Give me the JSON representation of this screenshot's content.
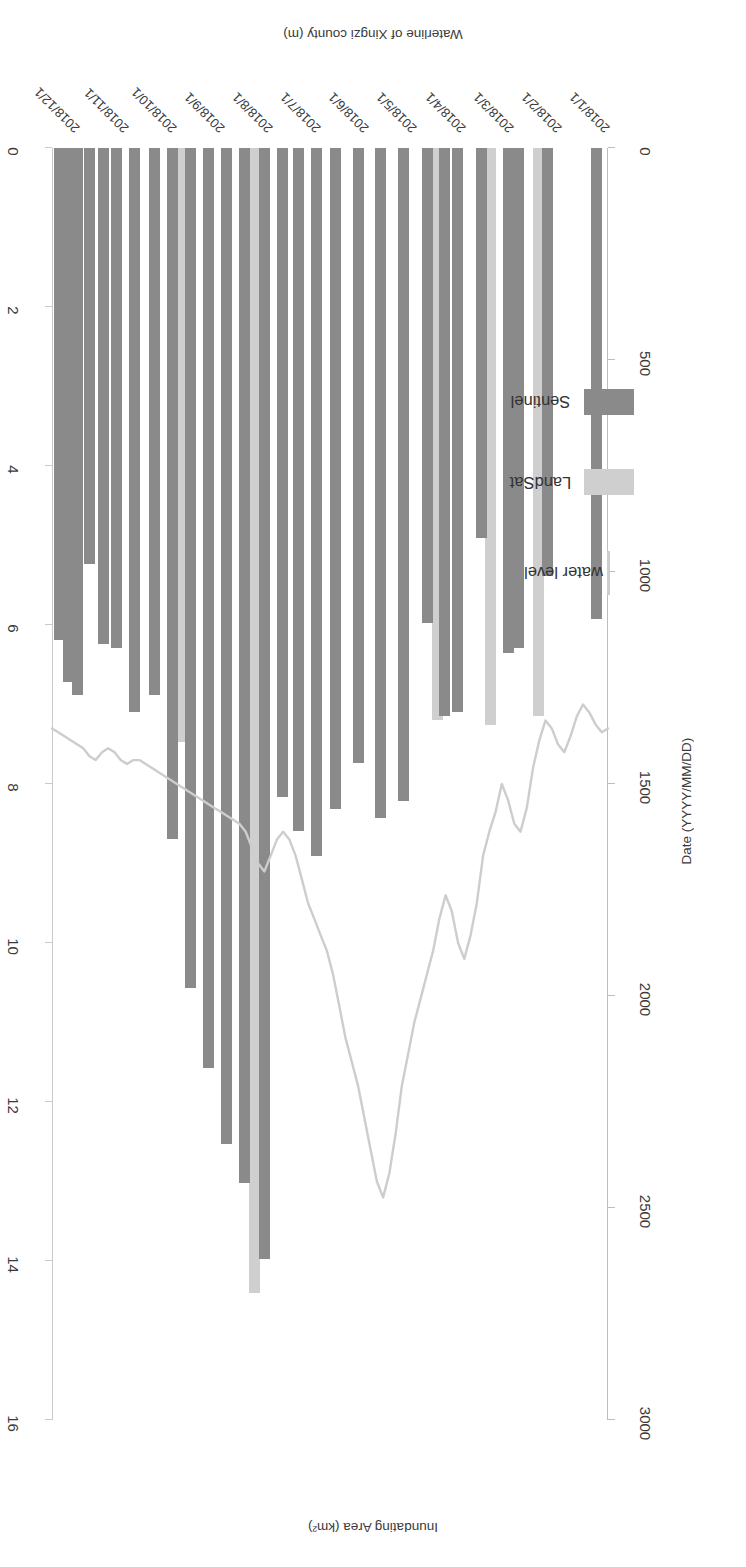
{
  "chart_data": {
    "type": "bar",
    "title": "",
    "xlabel": "Date (YYYY/MM/DD)",
    "ylabel": "Inundating Area (km²)",
    "y2label": "Waterline of Xingzi county (m)",
    "ylim": [
      0,
      3000
    ],
    "y2lim": [
      0,
      16
    ],
    "grid": false,
    "legend_position": "upper-right",
    "y_ticks": [
      "0",
      "500",
      "1000",
      "1500",
      "2000",
      "2500",
      "3000"
    ],
    "y2_ticks": [
      "0",
      "2",
      "4",
      "6",
      "8",
      "10",
      "12",
      "14",
      "16"
    ],
    "x_ticks": [
      "2018/1/1",
      "2018/2/1",
      "2018/3/1",
      "2018/4/1",
      "2018/5/1",
      "2018/6/1",
      "2018/7/1",
      "2018/8/1",
      "2018/9/1",
      "2018/10/1",
      "2018/11/1",
      "2018/12/1"
    ],
    "legend": [
      {
        "name": "Sentinel",
        "color": "#8a8a8a",
        "kind": "bar"
      },
      {
        "name": "LandSat",
        "color": "#cfcfcf",
        "kind": "bar"
      },
      {
        "name": "water level",
        "color": "#cdcdcd",
        "kind": "line"
      }
    ],
    "series": [
      {
        "name": "Sentinel",
        "color": "#8a8a8a",
        "points": [
          {
            "date": "2018/1/5",
            "x": 0.011,
            "value": 1110
          },
          {
            "date": "2018/2/6",
            "x": 0.1,
            "value": 1010
          },
          {
            "date": "2018/2/26",
            "x": 0.155,
            "value": 1180
          },
          {
            "date": "2018/3/4",
            "x": 0.173,
            "value": 1190
          },
          {
            "date": "2018/3/22",
            "x": 0.222,
            "value": 920
          },
          {
            "date": "2018/4/7",
            "x": 0.266,
            "value": 1330
          },
          {
            "date": "2018/4/15",
            "x": 0.289,
            "value": 1340
          },
          {
            "date": "2018/4/27",
            "x": 0.322,
            "value": 1120
          },
          {
            "date": "2018/5/13",
            "x": 0.366,
            "value": 1540
          },
          {
            "date": "2018/5/28",
            "x": 0.407,
            "value": 1580
          },
          {
            "date": "2018/6/12",
            "x": 0.448,
            "value": 1450
          },
          {
            "date": "2018/6/27",
            "x": 0.489,
            "value": 1560
          },
          {
            "date": "2018/7/10",
            "x": 0.525,
            "value": 1670
          },
          {
            "date": "2018/7/22",
            "x": 0.558,
            "value": 1610
          },
          {
            "date": "2018/8/2",
            "x": 0.588,
            "value": 1530
          },
          {
            "date": "2018/8/14",
            "x": 0.621,
            "value": 2620
          },
          {
            "date": "2018/8/27",
            "x": 0.657,
            "value": 2440
          },
          {
            "date": "2018/9/8",
            "x": 0.69,
            "value": 2350
          },
          {
            "date": "2018/9/20",
            "x": 0.723,
            "value": 2170
          },
          {
            "date": "2018/10/2",
            "x": 0.756,
            "value": 1980
          },
          {
            "date": "2018/10/14",
            "x": 0.789,
            "value": 1630
          },
          {
            "date": "2018/10/26",
            "x": 0.822,
            "value": 1290
          },
          {
            "date": "2018/11/8",
            "x": 0.858,
            "value": 1330
          },
          {
            "date": "2018/11/20",
            "x": 0.891,
            "value": 1180
          },
          {
            "date": "2018/11/29",
            "x": 0.916,
            "value": 1170
          },
          {
            "date": "2018/12/8",
            "x": 0.941,
            "value": 980
          },
          {
            "date": "2018/12/16",
            "x": 0.963,
            "value": 1290
          },
          {
            "date": "2018/12/22",
            "x": 0.98,
            "value": 1260
          },
          {
            "date": "2018/12/28",
            "x": 0.997,
            "value": 1160
          }
        ]
      },
      {
        "name": "LandSat",
        "color": "#cfcfcf",
        "points": [
          {
            "date": "2018/2/12",
            "x": 0.117,
            "value": 1340
          },
          {
            "date": "2018/3/16",
            "x": 0.205,
            "value": 1360
          },
          {
            "date": "2018/4/20",
            "x": 0.303,
            "value": 1350
          },
          {
            "date": "2018/8/20",
            "x": 0.639,
            "value": 2700
          },
          {
            "date": "2018/10/8",
            "x": 0.772,
            "value": 1400
          }
        ]
      },
      {
        "name": "water level",
        "color": "#cdcdcd",
        "kind": "line",
        "axis": "right",
        "values": [
          7.3,
          7.35,
          7.25,
          7.1,
          7.0,
          7.15,
          7.4,
          7.6,
          7.5,
          7.3,
          7.2,
          7.45,
          7.8,
          8.3,
          8.6,
          8.5,
          8.2,
          8.0,
          8.35,
          8.6,
          8.9,
          9.5,
          9.9,
          10.2,
          10.0,
          9.6,
          9.4,
          9.7,
          10.1,
          10.4,
          10.7,
          11.0,
          11.4,
          11.8,
          12.4,
          12.9,
          13.2,
          13.0,
          12.6,
          12.2,
          11.8,
          11.5,
          11.2,
          10.8,
          10.4,
          10.1,
          9.9,
          9.7,
          9.5,
          9.2,
          8.9,
          8.7,
          8.6,
          8.7,
          8.9,
          9.1,
          9.0,
          8.8,
          8.6,
          8.5,
          8.45,
          8.4,
          8.35,
          8.3,
          8.25,
          8.2,
          8.15,
          8.1,
          8.05,
          8.0,
          7.95,
          7.9,
          7.85,
          7.8,
          7.75,
          7.7,
          7.7,
          7.75,
          7.7,
          7.6,
          7.55,
          7.6,
          7.7,
          7.65,
          7.55,
          7.5,
          7.45,
          7.4,
          7.35,
          7.3
        ]
      }
    ]
  }
}
